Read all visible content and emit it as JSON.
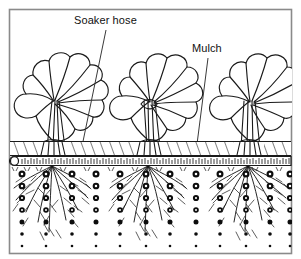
{
  "figure": {
    "style": "black-and-white line art"
  },
  "frame": {
    "border_color": "#8a8a8a",
    "background_color": "#ffffff"
  },
  "labels": [
    {
      "id": "soaker-hose",
      "text": "Soaker hose",
      "x": 74,
      "y": 24,
      "leader": {
        "x1": 106,
        "y1": 30,
        "x2": 80,
        "y2": 156
      }
    },
    {
      "id": "mulch",
      "text": "Mulch",
      "x": 192,
      "y": 52,
      "leader": {
        "x1": 208,
        "y1": 58,
        "x2": 196,
        "y2": 152
      }
    }
  ],
  "plants": [
    {
      "id": "plant-left",
      "name": "leafy-vegetable-plant",
      "center_x": 52,
      "base_y": 148,
      "width": 88,
      "top_y": 42
    },
    {
      "id": "plant-center",
      "name": "leafy-vegetable-plant",
      "center_x": 148,
      "base_y": 148,
      "width": 86,
      "top_y": 40
    },
    {
      "id": "plant-right",
      "name": "leafy-vegetable-plant",
      "center_x": 248,
      "base_y": 148,
      "width": 88,
      "top_y": 40
    }
  ],
  "layers": [
    {
      "id": "mulch-layer",
      "name": "Mulch",
      "top_y": 141,
      "bottom_y": 155,
      "fill": "diagonal-hatch"
    },
    {
      "id": "soaker-hose-tube",
      "name": "Soaker hose",
      "y": 158,
      "height": 9,
      "x1": 10,
      "x2": 292
    },
    {
      "id": "soil-layer",
      "name": "Soil",
      "top_y": 166,
      "bottom_y": 254,
      "fill": "white"
    }
  ],
  "soaker_hose": {
    "open_end_x": 14,
    "open_end_y": 160,
    "stipple": true
  },
  "root_systems": [
    {
      "id": "roots-left",
      "origin_x": 52,
      "origin_y": 166,
      "spread": 74,
      "depth": 86
    },
    {
      "id": "roots-center",
      "origin_x": 148,
      "origin_y": 166,
      "spread": 74,
      "depth": 86
    },
    {
      "id": "roots-right",
      "origin_x": 248,
      "origin_y": 166,
      "spread": 74,
      "depth": 86
    }
  ],
  "water_droplets": {
    "name": "water-droplet",
    "description": "Columns of round droplets showing water soaking downward through the soil",
    "columns_x": [
      22,
      46,
      72,
      96,
      120,
      146,
      170,
      196,
      220,
      246,
      270,
      290
    ],
    "rows_y": [
      174,
      186,
      198,
      210,
      222,
      234,
      246
    ],
    "shrink_with_depth": true
  },
  "colors": {
    "ink": "#111111",
    "line": "#1a1a1a",
    "paper": "#ffffff",
    "frame": "#8a8a8a"
  }
}
